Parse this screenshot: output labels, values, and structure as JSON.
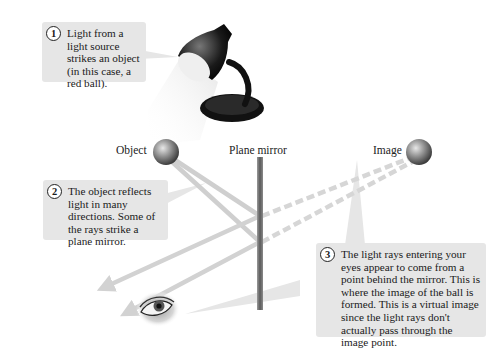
{
  "diagram": {
    "type": "plane-mirror-reflection",
    "labels": {
      "object": "Object",
      "mirror": "Plane mirror",
      "image": "Image"
    },
    "callouts": [
      {
        "number": "1",
        "text": "Light from a light source strikes an object (in this case, a red ball)."
      },
      {
        "number": "2",
        "text": "The object reflects light in many directions. Some of the rays strike a plane mirror."
      },
      {
        "number": "3",
        "text": "The light rays entering your eyes appear to come from a point behind the mirror. This is where the image of the ball is formed. This is a virtual image since the light rays don't actually pass through the image point."
      }
    ],
    "elements": [
      "lamp-icon",
      "object-ball",
      "plane-mirror",
      "image-ball",
      "eye-icon"
    ],
    "colors": {
      "callout_bg": "#e6e6e6",
      "ray": "#cfcfcf",
      "mirror": "#6a6a6a",
      "ball": "#8a8a8a"
    }
  }
}
